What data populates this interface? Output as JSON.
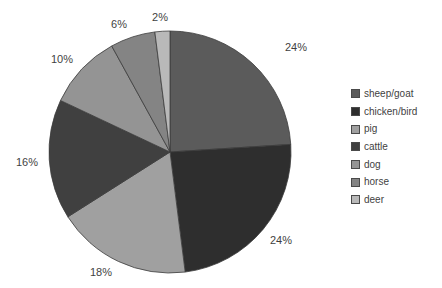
{
  "chart_data": {
    "type": "pie",
    "title": "",
    "categories": [
      "sheep/goat",
      "chicken/bird",
      "pig",
      "cattle",
      "dog",
      "horse",
      "deer"
    ],
    "values": [
      24,
      24,
      18,
      16,
      10,
      6,
      2
    ],
    "value_labels": [
      "24%",
      "24%",
      "18%",
      "16%",
      "10%",
      "6%",
      "2%"
    ],
    "unit": "%",
    "colors": [
      "#5b5b5b",
      "#2e2e2e",
      "#a0a0a0",
      "#404040",
      "#949494",
      "#848484",
      "#b9b9b9"
    ],
    "slice_border_color": "#3c3c3c",
    "data_label_color": "#3f3f3f",
    "legend_text_color": "#3f3f3f",
    "background_color": "#ffffff",
    "legend_position": "right",
    "start_angle_deg": 0,
    "direction": "clockwise",
    "grid": "off"
  }
}
